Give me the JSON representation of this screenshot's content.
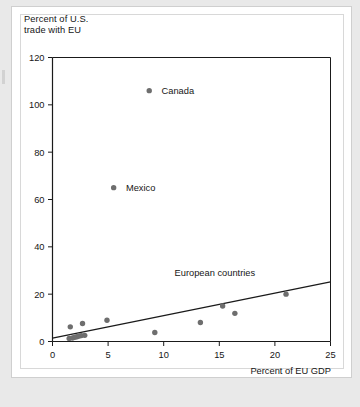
{
  "chart_data": {
    "type": "scatter",
    "title": "",
    "ylabel": "Percent of U.S.\ntrade with EU",
    "xlabel": "Percent of EU GDP",
    "xlim": [
      0,
      25
    ],
    "ylim": [
      0,
      120
    ],
    "xticks": [
      0,
      5,
      10,
      15,
      20,
      25
    ],
    "yticks": [
      0,
      20,
      40,
      60,
      80,
      100,
      120
    ],
    "grid": false,
    "legend": "none",
    "point_color": "#6e6e6e",
    "line_color": "#1a1a1a",
    "axis_color": "#1a1a1a",
    "series": [
      {
        "name": "Countries",
        "points": [
          {
            "x": 8.7,
            "y": 106,
            "label": "Canada"
          },
          {
            "x": 5.5,
            "y": 65,
            "label": "Mexico"
          },
          {
            "x": 1.6,
            "y": 6.2,
            "label": ""
          },
          {
            "x": 2.7,
            "y": 7.6,
            "label": ""
          },
          {
            "x": 4.9,
            "y": 9.0,
            "label": ""
          },
          {
            "x": 9.2,
            "y": 3.8,
            "label": ""
          },
          {
            "x": 13.3,
            "y": 8.0,
            "label": ""
          },
          {
            "x": 15.3,
            "y": 15.0,
            "label": ""
          },
          {
            "x": 16.4,
            "y": 11.9,
            "label": ""
          },
          {
            "x": 21.0,
            "y": 20.0,
            "label": ""
          },
          {
            "x": 1.5,
            "y": 1.3,
            "label": ""
          },
          {
            "x": 1.8,
            "y": 1.5,
            "label": ""
          },
          {
            "x": 2.0,
            "y": 1.8,
            "label": ""
          },
          {
            "x": 2.2,
            "y": 2.0,
            "label": ""
          },
          {
            "x": 2.4,
            "y": 2.3,
            "label": ""
          },
          {
            "x": 2.6,
            "y": 2.5,
            "label": ""
          },
          {
            "x": 2.9,
            "y": 2.6,
            "label": ""
          }
        ]
      }
    ],
    "trend_line": {
      "label": "European countries",
      "from": {
        "x": 0,
        "y": 1.4
      },
      "to": {
        "x": 25,
        "y": 25.2
      }
    },
    "annotations": [
      {
        "text": "European countries",
        "x": 14.6,
        "y": 27.5
      },
      {
        "text": "Canada",
        "x": 9.4,
        "y": 106
      },
      {
        "text": "Mexico",
        "x": 6.2,
        "y": 65
      }
    ]
  }
}
